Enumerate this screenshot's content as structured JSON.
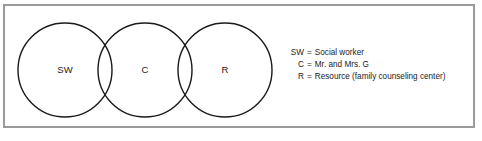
{
  "figure": {
    "type": "venn-diagram",
    "frame_color": "#9a9a9a",
    "stroke_color": "#1a1a1a",
    "background": "#ffffff"
  },
  "venn": {
    "circles": [
      {
        "id": "sw",
        "label": "SW",
        "cx": 65,
        "cy": 70,
        "r": 47
      },
      {
        "id": "c",
        "label": "C",
        "cx": 145,
        "cy": 70,
        "r": 47
      },
      {
        "id": "r",
        "label": "R",
        "cx": 225,
        "cy": 70,
        "r": 47
      }
    ]
  },
  "legend": {
    "items": [
      {
        "key": "SW",
        "eq": "=",
        "desc": "Social worker"
      },
      {
        "key": "C",
        "eq": "=",
        "desc": "Mr. and Mrs. G"
      },
      {
        "key": "R",
        "eq": "=",
        "desc": "Resource (family counseling center)"
      }
    ]
  }
}
